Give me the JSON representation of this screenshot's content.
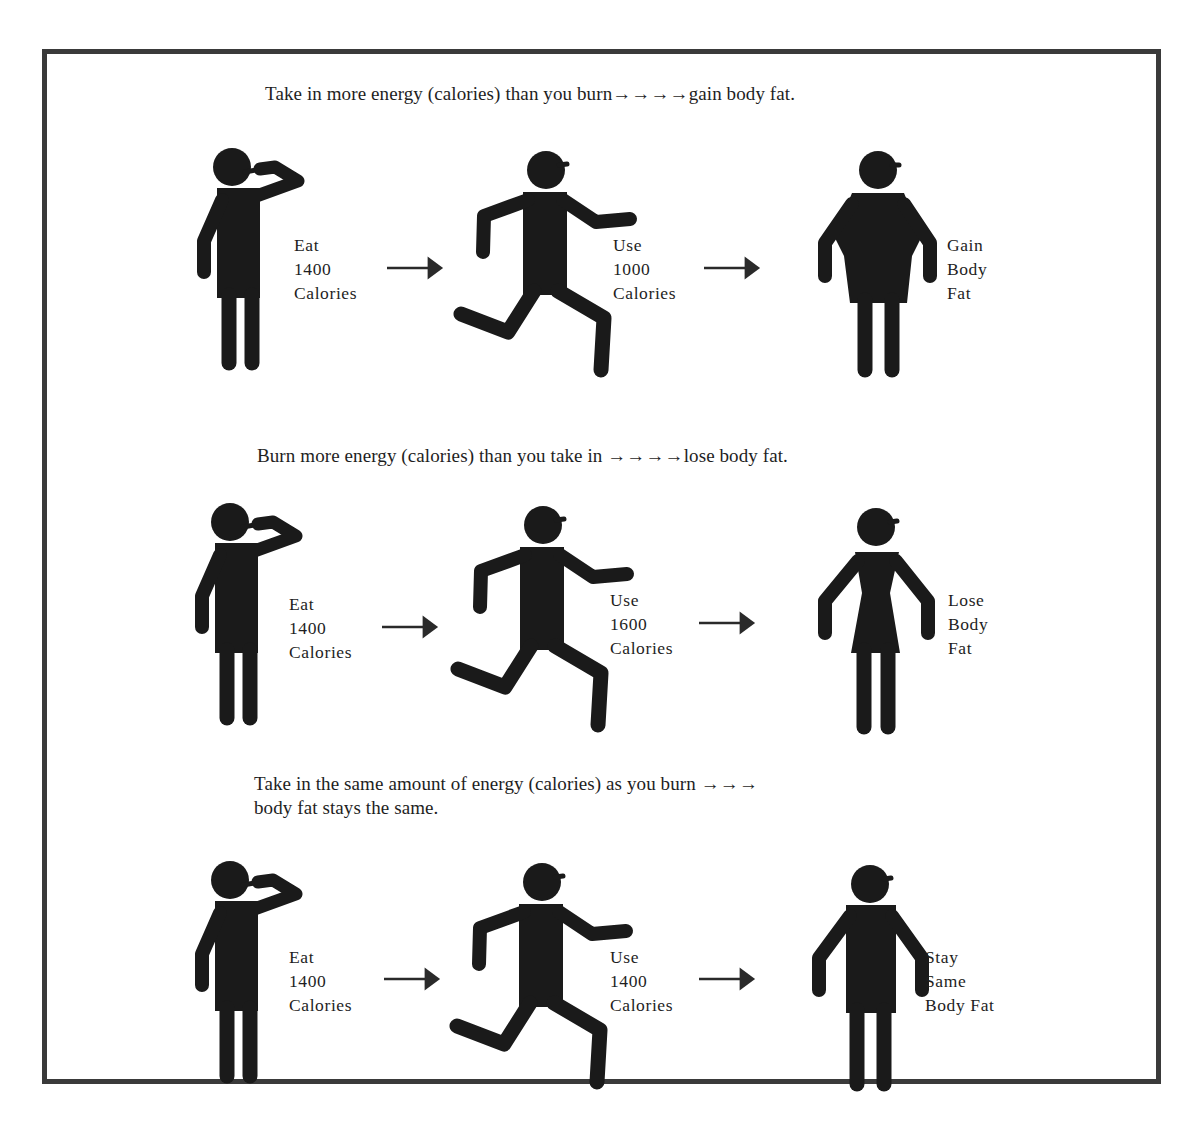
{
  "diagram": {
    "colors": {
      "ink": "#1a1a1a",
      "frame": "#3a3a3a",
      "background": "#ffffff"
    },
    "rows": [
      {
        "caption": "Take in more energy (calories) than you burn→→→→gain body fat.",
        "steps": [
          {
            "figure": "eating-person-icon",
            "label": "Eat\n1400\nCalories"
          },
          {
            "figure": "running-person-icon",
            "label": "Use\n1000\nCalories"
          },
          {
            "figure": "heavier-person-icon",
            "label": "Gain\nBody\nFat"
          }
        ]
      },
      {
        "caption": "Burn more energy (calories) than you take in →→→→lose body fat.",
        "steps": [
          {
            "figure": "eating-person-icon",
            "label": "Eat\n1400\nCalories"
          },
          {
            "figure": "running-person-icon",
            "label": "Use\n1600\nCalories"
          },
          {
            "figure": "slimmer-person-icon",
            "label": "Lose\nBody\nFat"
          }
        ]
      },
      {
        "caption_line1": "Take in the same amount of energy (calories) as you burn →→→",
        "caption_line2": "body fat stays the same.",
        "steps": [
          {
            "figure": "eating-person-icon",
            "label": "Eat\n1400\nCalories"
          },
          {
            "figure": "running-person-icon",
            "label": "Use\n1400\nCalories"
          },
          {
            "figure": "standing-person-icon",
            "label": "Stay\nSame\nBody Fat"
          }
        ]
      }
    ]
  }
}
